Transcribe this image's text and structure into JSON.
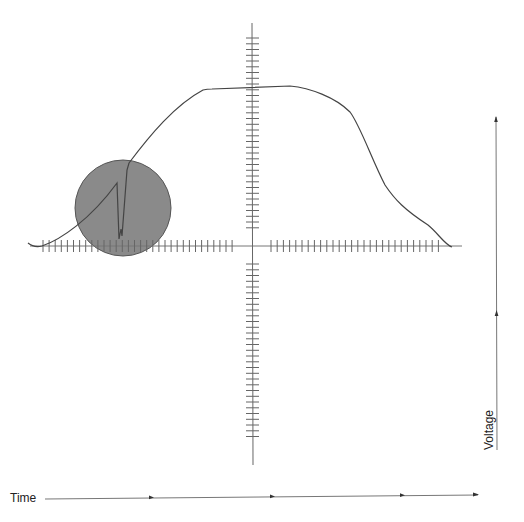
{
  "diagram": {
    "type": "oscilloscope-waveform-sketch",
    "axes": {
      "x_label": "Time",
      "y_label": "Voltage"
    },
    "highlight": {
      "shape": "circle",
      "description": "glitch region on rising edge",
      "color": "#8a8a8a"
    },
    "colors": {
      "line": "#444444",
      "axis": "#555555",
      "highlight_fill": "#8a8a8a"
    }
  }
}
